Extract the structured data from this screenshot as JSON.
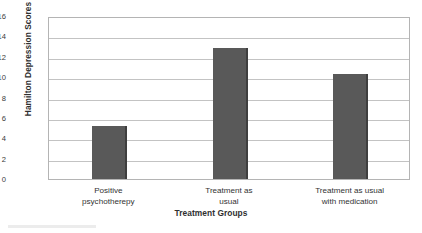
{
  "chart_data": {
    "type": "bar",
    "title": "",
    "xlabel": "Treatment Groups",
    "ylabel": "Hamilton Depression Scores",
    "categories": [
      "Positive\npsychotherepy",
      "Treatment as\nusual",
      "Treatment as usual\nwith medication"
    ],
    "values": [
      5.2,
      12.9,
      10.3
    ],
    "ylim": [
      0,
      16
    ],
    "ytick_labels": [
      "16",
      "14",
      "12",
      "10",
      "8",
      "6",
      "4",
      "2",
      "0"
    ],
    "ytick_values": [
      16,
      14,
      12,
      10,
      8,
      6,
      4,
      2,
      0
    ],
    "ytick_step": 2,
    "grid": true,
    "grid_axis": "y",
    "legend": false,
    "legend_position": "none",
    "bar_color": "#595959",
    "bar_edge_color": "#3f3f3f",
    "grid_color": "#c3c3c3",
    "frame_color": "#b4b4b4",
    "background_color": "#ffffff"
  }
}
